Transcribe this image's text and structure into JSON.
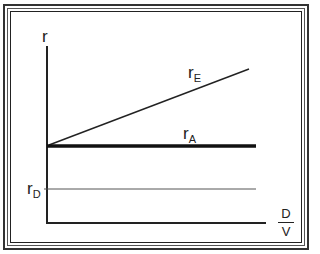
{
  "diagram": {
    "y_axis_label": "r",
    "x_axis": {
      "numerator": "D",
      "denominator": "V"
    },
    "lines": [
      {
        "id": "rE",
        "label_main": "r",
        "label_sub": "E",
        "description": "cost of equity, rising with D/V",
        "color": "#222222"
      },
      {
        "id": "rA",
        "label_main": "r",
        "label_sub": "A",
        "description": "cost of assets, constant (thick)",
        "color": "#111111"
      },
      {
        "id": "rD",
        "label_main": "r",
        "label_sub": "D",
        "description": "cost of debt, constant (thin)",
        "color": "#444444"
      }
    ]
  }
}
